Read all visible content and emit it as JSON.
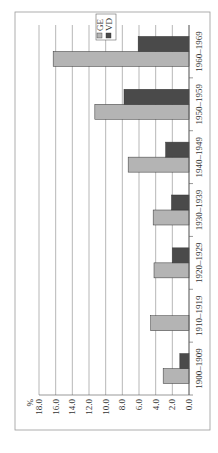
{
  "chart_data": {
    "type": "bar",
    "orientation": "rotated-90-ccw",
    "title": "",
    "ylabel": "%",
    "xlabel": "",
    "ylim": [
      0,
      18
    ],
    "yticks": [
      "0.0",
      "2.0",
      "4.0",
      "6.0",
      "8.0",
      "10.0",
      "12.0",
      "14.0",
      "16.0",
      "18.0"
    ],
    "grid": true,
    "legend_position": "top-right",
    "categories": [
      "1900–1909",
      "1910–1919",
      "1920–1929",
      "1930–1939",
      "1940–1949",
      "1950–1959",
      "1960–1969"
    ],
    "series": [
      {
        "name": "GE",
        "color": "#b4b4b4",
        "values": [
          3.1,
          4.6,
          4.2,
          4.3,
          7.3,
          11.3,
          16.3
        ]
      },
      {
        "name": "VD",
        "color": "#4a4a4a",
        "values": [
          1.1,
          0.0,
          2.0,
          2.1,
          2.8,
          7.8,
          6.1
        ]
      }
    ]
  }
}
